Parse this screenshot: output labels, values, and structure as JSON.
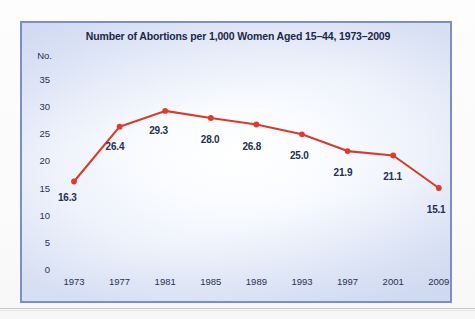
{
  "page": {
    "background_color": "#fbfbfb",
    "rule_color": "#c9c9c9"
  },
  "chart_panel": {
    "border_color": "#7b8fc4",
    "background_center_color": "#ffffff",
    "background_edge_color": "#d8e0f3"
  },
  "chart_data": {
    "type": "line",
    "title": "Number of Abortions per 1,000 Women Aged 15–44, 1973–2009",
    "xlabel": "",
    "ylabel": "No.",
    "categories": [
      "1973",
      "1977",
      "1981",
      "1985",
      "1989",
      "1993",
      "1997",
      "2001",
      "2009"
    ],
    "values": [
      16.3,
      26.4,
      29.3,
      28.0,
      26.8,
      25.0,
      21.9,
      21.1,
      15.1
    ],
    "point_labels": [
      "16.3",
      "26.4",
      "29.3",
      "28.0",
      "26.8",
      "25.0",
      "21.9",
      "21.1",
      "15.1"
    ],
    "ylim": [
      0,
      35
    ],
    "yticks": [
      "35",
      "30",
      "25",
      "20",
      "15",
      "10",
      "5",
      "0"
    ],
    "ytick_values": [
      35,
      30,
      25,
      20,
      15,
      10,
      5,
      0
    ],
    "grid": false,
    "legend": false,
    "series_color": "#d93b2b",
    "marker_color": "#e03a2a",
    "label_color": "#24304d",
    "axis_text_color": "#2a3350",
    "title_color": "#1d2747"
  }
}
